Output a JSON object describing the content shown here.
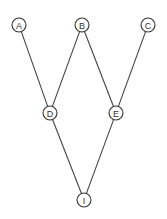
{
  "diagram": {
    "type": "graph",
    "nodes": [
      {
        "id": "A",
        "label": "A",
        "x": 19,
        "y": 25
      },
      {
        "id": "B",
        "label": "B",
        "x": 82,
        "y": 25
      },
      {
        "id": "C",
        "label": "C",
        "x": 148,
        "y": 25
      },
      {
        "id": "D",
        "label": "D",
        "x": 50,
        "y": 113
      },
      {
        "id": "E",
        "label": "E",
        "x": 116,
        "y": 113
      },
      {
        "id": "I",
        "label": "I",
        "x": 84,
        "y": 200
      }
    ],
    "edges": [
      {
        "from": "A",
        "to": "D"
      },
      {
        "from": "B",
        "to": "D"
      },
      {
        "from": "B",
        "to": "E"
      },
      {
        "from": "C",
        "to": "E"
      },
      {
        "from": "D",
        "to": "I"
      },
      {
        "from": "E",
        "to": "I"
      }
    ],
    "node_radius": 7
  }
}
